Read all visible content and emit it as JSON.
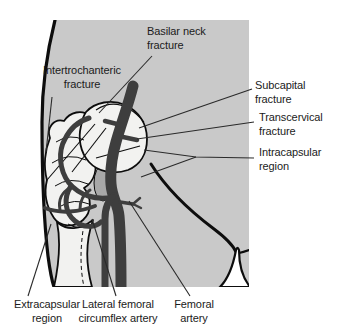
{
  "figure_type": "hip fracture anatomy diagram",
  "colors": {
    "page_bg": "#ffffff",
    "panel_bg": "#c9c9c9",
    "bone_fill": "#f2f2f0",
    "bone_shadow": "#a8a8a8",
    "artery": "#3e3e3e",
    "outline": "#0d0d0d",
    "leader": "#2a2a2a",
    "text": "#1b1b1b"
  },
  "annotations": {
    "basilar": {
      "line1": "Basilar neck",
      "line2": "fracture"
    },
    "intertrochanteric": {
      "line1": "Intertrochanteric",
      "line2": "fracture"
    },
    "subcapital": {
      "line1": "Subcapital",
      "line2": "fracture"
    },
    "transcervical": {
      "line1": "Transcervical",
      "line2": "fracture"
    },
    "intracapsular": {
      "line1": "Intracapsular",
      "line2": "region"
    },
    "extracapsular": {
      "line1": "Extracapsular",
      "line2": "region"
    },
    "lateral_circumflex": {
      "line1": "Lateral femoral",
      "line2": "circumflex artery"
    },
    "femoral": {
      "line1": "Femoral",
      "line2": "artery"
    }
  }
}
